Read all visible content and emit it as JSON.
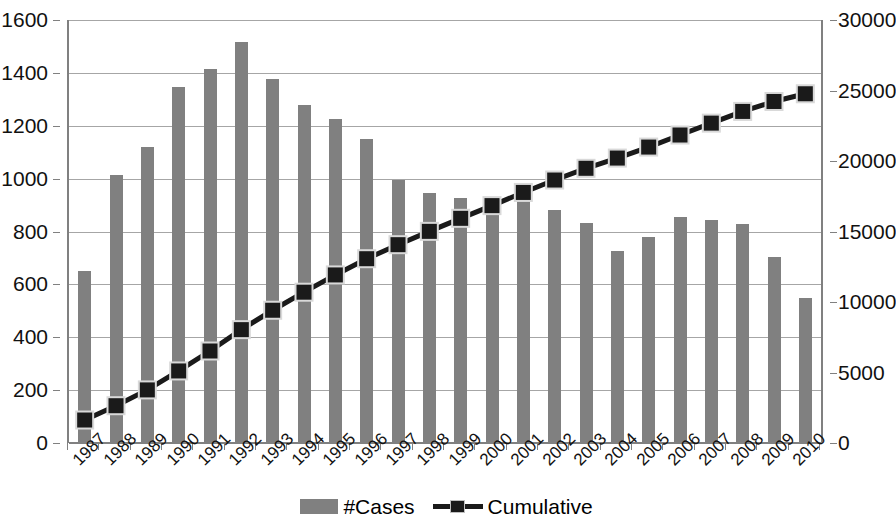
{
  "chart_data": {
    "type": "bar",
    "title": "",
    "subtitle": "",
    "xlabel": "",
    "ylabel": "",
    "categories": [
      "1987",
      "1988",
      "1989",
      "1990",
      "1991",
      "1992",
      "1993",
      "1994",
      "1995",
      "1996",
      "1997",
      "1998",
      "1999",
      "2000",
      "2001",
      "2002",
      "2003",
      "2004",
      "2005",
      "2006",
      "2007",
      "2008",
      "2009",
      "2010"
    ],
    "grid": true,
    "legend_position": "bottom",
    "axes": {
      "left": {
        "label": "",
        "min": 0,
        "max": 1600,
        "step": 200,
        "ticks": [
          "0",
          "200",
          "400",
          "600",
          "800",
          "1000",
          "1200",
          "1400",
          "1600"
        ]
      },
      "right": {
        "label": "",
        "min": 0,
        "max": 30000,
        "step": 5000,
        "ticks": [
          "0",
          "5000",
          "10000",
          "15000",
          "20000",
          "25000",
          "30000"
        ]
      }
    },
    "series": [
      {
        "name": "#Cases",
        "type": "bar",
        "axis": "left",
        "color": "#808080",
        "values": [
          650,
          1015,
          1120,
          1345,
          1415,
          1515,
          1375,
          1280,
          1225,
          1150,
          995,
          945,
          925,
          900,
          935,
          880,
          832,
          726,
          780,
          855,
          843,
          830,
          705,
          548
        ]
      },
      {
        "name": "Cumulative",
        "type": "line",
        "axis": "right",
        "color": "#1a1a1a",
        "marker": "square",
        "values": [
          1630,
          2645,
          3765,
          5110,
          6525,
          8040,
          9415,
          10695,
          11920,
          13070,
          14065,
          15010,
          15935,
          16835,
          17770,
          18650,
          19482,
          20208,
          20988,
          21843,
          22686,
          23516,
          24221,
          24769
        ]
      }
    ]
  },
  "legend": {
    "entries": [
      {
        "label": "#Cases",
        "icon": "bar-swatch"
      },
      {
        "label": "Cumulative",
        "icon": "line-marker-swatch"
      }
    ]
  }
}
